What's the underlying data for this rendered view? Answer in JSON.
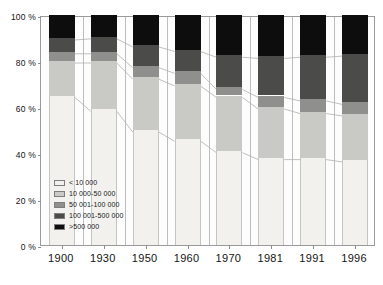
{
  "chart_data": {
    "type": "bar",
    "subtype": "stacked-percentage",
    "title": "",
    "xlabel": "",
    "ylabel": "",
    "categories": [
      "1900",
      "1930",
      "1950",
      "1960",
      "1970",
      "1981",
      "1991",
      "1996"
    ],
    "ylim": [
      0,
      100
    ],
    "yticks": [
      "0 %",
      "20 %",
      "40 %",
      "60 %",
      "80 %",
      "100 %"
    ],
    "ytick_values": [
      0,
      20,
      40,
      60,
      80,
      100
    ],
    "grid": false,
    "legend_position": "inside-lower-left",
    "series": [
      {
        "name": "< 10 000",
        "color": "#f2f1ee",
        "values": [
          65,
          59,
          50,
          46,
          41,
          38,
          38,
          37
        ]
      },
      {
        "name": "10 000-50 000",
        "color": "#c9c9c5",
        "values": [
          15,
          21,
          23,
          24,
          24,
          22,
          20,
          20
        ]
      },
      {
        "name": "50 001-100 000",
        "color": "#8f8f8d",
        "values": [
          4,
          4,
          5,
          5.5,
          3.5,
          5,
          5.5,
          5
        ]
      },
      {
        "name": "100 001-500 000",
        "color": "#4b4b4a",
        "values": [
          6,
          6.5,
          9,
          9.5,
          14,
          17,
          19,
          21
        ]
      },
      {
        "name": ">500 000",
        "color": "#0d0d0d",
        "values": [
          10,
          9.5,
          13,
          15,
          17.5,
          18,
          17.5,
          17
        ]
      }
    ],
    "cumulative_tops": [
      [
        65,
        80,
        84,
        90,
        100
      ],
      [
        59,
        80,
        84,
        90.5,
        100
      ],
      [
        50,
        73,
        78,
        87,
        100
      ],
      [
        46,
        70,
        75.5,
        85,
        100
      ],
      [
        41,
        65,
        68.5,
        82.5,
        100
      ],
      [
        38,
        60,
        65,
        82,
        100
      ],
      [
        38,
        58,
        63.5,
        82.5,
        100
      ],
      [
        37,
        57,
        62,
        83,
        100
      ]
    ]
  },
  "legend": {
    "items": [
      {
        "label": "< 10 000",
        "color": "#f2f1ee"
      },
      {
        "label": "10 000-50 000",
        "color": "#c9c9c5"
      },
      {
        "label": "50 001-100 000",
        "color": "#8f8f8d"
      },
      {
        "label": "100 001-500 000",
        "color": "#4b4b4a"
      },
      {
        "label": ">500 000",
        "color": "#0d0d0d"
      }
    ]
  },
  "axes": {
    "y_ticks": [
      "100 %",
      "80 %",
      "60 %",
      "40 %",
      "20 %",
      "0 %"
    ],
    "x_ticks": [
      "1900",
      "1930",
      "1950",
      "1960",
      "1970",
      "1981",
      "1991",
      "1996"
    ]
  },
  "colors": {
    "frame": "#9a9a9a",
    "connector": "#b0b0b0",
    "background": "#ffffff"
  }
}
